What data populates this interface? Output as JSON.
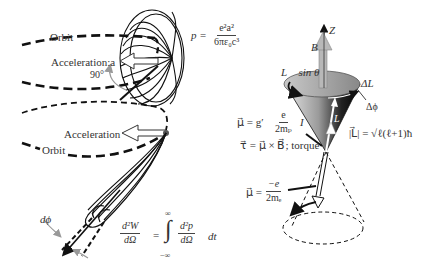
{
  "left_panel": {
    "labels": {
      "orbit_top": "Orbit",
      "acceleration_a": "Acceleration:a",
      "angle_90": "90°",
      "acceleration": "Acceleration",
      "orbit_bottom": "Orbit",
      "dphi": "dϕ"
    },
    "power_formula": {
      "lhs": "p =",
      "numerator": "e²a²",
      "denominator": "6πε₀c³"
    },
    "energy_formula": {
      "lhs_num": "d²W",
      "lhs_den": "dΩ",
      "equals": "=",
      "upper_limit": "∞",
      "lower_limit": "−∞",
      "integral": "∫",
      "rhs_num": "d²p",
      "rhs_den": "dΩ",
      "dt": "dt"
    }
  },
  "right_panel": {
    "labels": {
      "z_axis": "Z",
      "b_field": "B⃗",
      "l_sin_theta": "L⃗ sin θ",
      "delta_l": "ΔL⃗",
      "delta_phi": "Δϕ",
      "l_vector": "L⃗",
      "torque": "τ⃗ = μ⃗ × B⃗; torque"
    },
    "mu_proton": {
      "lhs": "μ⃗ = g′",
      "numerator": "e",
      "denominator": "2mₚ",
      "suffix": "I"
    },
    "angular_momentum": "|L⃗| = √ℓ(ℓ+1)ħ",
    "mu_electron": {
      "lhs": "μ⃗ =",
      "numerator": "−e",
      "denominator": "2mₑ"
    }
  },
  "colors": {
    "line": "#111111",
    "text": "#333333",
    "arrow_gray": "#9a9a9a",
    "cone_dark": "#111111",
    "cone_light": "#d8d8d8"
  }
}
